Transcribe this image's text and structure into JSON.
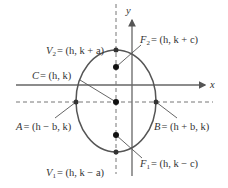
{
  "diagram": {
    "type": "ellipse-vertical-major-axis",
    "axes": {
      "x_label": "x",
      "y_label": "y"
    },
    "colors": {
      "ink": "#444444",
      "point": "#111111",
      "dashed": "#777777",
      "background": "#ffffff"
    },
    "points": {
      "V2": {
        "name": "V",
        "sub": "2",
        "coords": "= (h, k + a)"
      },
      "F2": {
        "name": "F",
        "sub": "2",
        "coords": "= (h, k + c)"
      },
      "C": {
        "name": "C",
        "sub": "",
        "coords": "= (h, k)"
      },
      "A": {
        "name": "A",
        "sub": "",
        "coords": "= (h − b, k)"
      },
      "B": {
        "name": "B",
        "sub": "",
        "coords": "= (h + b, k)"
      },
      "V1": {
        "name": "V",
        "sub": "1",
        "coords": "= (h, k − a)"
      },
      "F1": {
        "name": "F",
        "sub": "1",
        "coords": "= (h, k − c)"
      }
    }
  }
}
